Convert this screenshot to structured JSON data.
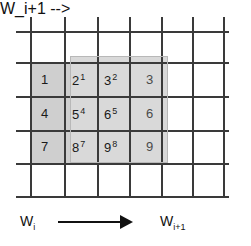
{
  "figure": {
    "type": "grid-sliding-window-diagram",
    "background": "#ffffff",
    "grid_line_color": "#3a3a3a",
    "window_fill_color": "#d4d4d4"
  },
  "grid": {
    "vertical_lines_x": [
      30,
      64,
      97,
      129,
      161,
      192,
      223
    ],
    "horizontal_lines_y": [
      31,
      62,
      96,
      130,
      163,
      196
    ],
    "columns": 6,
    "rows": 5
  },
  "windows": [
    {
      "name": "W_i",
      "label": "W",
      "subscript": "i",
      "x": 30,
      "y": 62,
      "width": 107,
      "height": 101,
      "fill": "#cfcfcf"
    },
    {
      "name": "W_i+1",
      "label": "W",
      "subscript": "i+1",
      "x": 70,
      "y": 56,
      "width": 98,
      "height": 107,
      "fill": "#d9d9d9"
    }
  ],
  "cells": [
    {
      "value": "1",
      "superscript": "",
      "x": 41,
      "y": 73,
      "faded": false
    },
    {
      "value": "2",
      "superscript": "1",
      "x": 72,
      "y": 73,
      "faded": false
    },
    {
      "value": "3",
      "superscript": "2",
      "x": 104,
      "y": 73,
      "faded": false
    },
    {
      "value": "3",
      "superscript": "",
      "x": 146,
      "y": 73,
      "faded": true
    },
    {
      "value": "4",
      "superscript": "",
      "x": 41,
      "y": 107,
      "faded": false
    },
    {
      "value": "5",
      "superscript": "4",
      "x": 72,
      "y": 107,
      "faded": false
    },
    {
      "value": "6",
      "superscript": "5",
      "x": 104,
      "y": 107,
      "faded": false
    },
    {
      "value": "6",
      "superscript": "",
      "x": 146,
      "y": 107,
      "faded": true
    },
    {
      "value": "7",
      "superscript": "",
      "x": 41,
      "y": 140,
      "faded": false
    },
    {
      "value": "8",
      "superscript": "7",
      "x": 72,
      "y": 140,
      "faded": false
    },
    {
      "value": "9",
      "superscript": "8",
      "x": 104,
      "y": 140,
      "faded": false
    },
    {
      "value": "9",
      "superscript": "",
      "x": 146,
      "y": 140,
      "faded": true
    }
  ],
  "axis": {
    "left_label_main": "W",
    "left_label_sub": "i",
    "right_label_main": "W",
    "right_label_sub": "i+1",
    "arrow_direction": "right",
    "arrow_x": 58,
    "arrow_y": 221,
    "arrow_length": 62
  }
}
